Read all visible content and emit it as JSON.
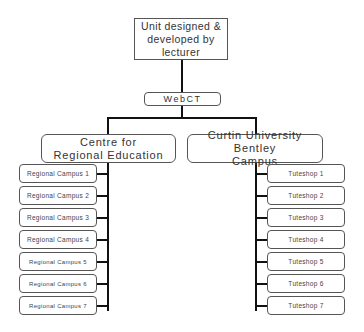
{
  "diagram": {
    "root": {
      "label_line1": "Unit designed &",
      "label_line2": "developed by lecturer"
    },
    "platform": {
      "label": "WebCT"
    },
    "branches": [
      {
        "label_line1": "Centre for",
        "label_line2": "Regional Education",
        "children": [
          "Regional Campus 1",
          "Regional Campus 2",
          "Regional Campus 3",
          "Regional Campus 4",
          "Regional Campus 5",
          "Regional Campus 6",
          "Regional Campus 7"
        ]
      },
      {
        "label_line1": "Curtin University Bentley",
        "label_line2": "Campus",
        "children": [
          "Tuteshop 1",
          "Tuteshop 2",
          "Tuteshop 3",
          "Tuteshop 4",
          "Tuteshop 5",
          "Tuteshop 6",
          "Tuteshop 7"
        ]
      }
    ],
    "colors": {
      "line": "#111111",
      "border": "#555555",
      "text": "#333333",
      "background": "#ffffff"
    }
  }
}
